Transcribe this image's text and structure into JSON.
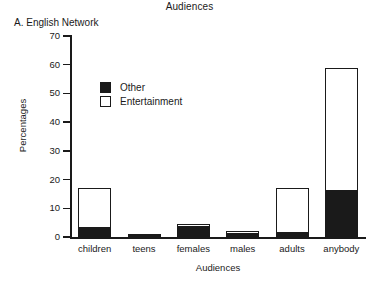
{
  "chart_data": {
    "type": "bar",
    "title": "Audiences",
    "panel_label": "A. English Network",
    "xlabel": "Audiences",
    "ylabel": "Percentages",
    "ylim": [
      0,
      70
    ],
    "yticks": [
      70,
      60,
      50,
      40,
      30,
      20,
      10,
      0
    ],
    "grid": false,
    "stacked": true,
    "legend_position": "upper-left-inside",
    "categories": [
      "children",
      "teens",
      "females",
      "males",
      "adults",
      "anybody"
    ],
    "series": [
      {
        "name": "Other",
        "color": "#1a1a1a",
        "swatch": "filled",
        "values": [
          3,
          1,
          3.5,
          1,
          1.5,
          16
        ]
      },
      {
        "name": "Entertainment",
        "color": "#ffffff",
        "swatch": "hollow",
        "values": [
          14,
          0,
          1,
          1,
          15.5,
          43
        ]
      }
    ],
    "totals": [
      17,
      1,
      4.5,
      2,
      17,
      59
    ]
  },
  "colors": {
    "ink": "#1a1a1a",
    "fill_other": "#1a1a1a",
    "fill_entertainment": "#ffffff",
    "background": "#ffffff"
  }
}
